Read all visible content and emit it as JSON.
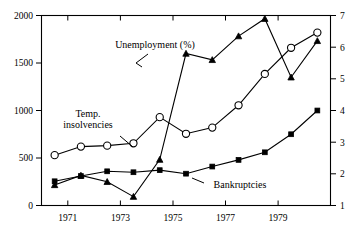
{
  "chart_data": {
    "type": "line",
    "title": "",
    "subtitle": "",
    "xlabel": "",
    "ylabel": "",
    "y2label": "",
    "grid": false,
    "legend_position": "inline-annotations",
    "x": [
      1970,
      1971,
      1972,
      1973,
      1974,
      1975,
      1976,
      1977,
      1978,
      1979,
      1980
    ],
    "xlim": [
      1969.5,
      1980.5
    ],
    "xticks_major": [
      1971,
      1973,
      1975,
      1977,
      1979
    ],
    "xtick_labels": [
      "1971",
      "1973",
      "1975",
      "1977",
      "1979"
    ],
    "xticks_minor": [
      1970,
      1972,
      1974,
      1976,
      1978,
      1980
    ],
    "left_axis": {
      "ylim": [
        0,
        2000
      ],
      "ticks": [
        0,
        500,
        1000,
        1500,
        2000
      ],
      "tick_labels": [
        "0",
        "500",
        "1000",
        "1500",
        "2000"
      ]
    },
    "right_axis": {
      "ylim": [
        1,
        7
      ],
      "ticks": [
        1,
        2,
        3,
        4,
        5,
        6,
        7
      ],
      "tick_labels": [
        "1",
        "2",
        "3",
        "4",
        "5",
        "6",
        "7"
      ]
    },
    "series": [
      {
        "name": "Temp. insolvencies",
        "label": "Temp.",
        "label_line2": "insolvencies",
        "axis": "left",
        "marker": "circle-open",
        "values": [
          530,
          620,
          630,
          655,
          930,
          755,
          820,
          1055,
          1385,
          1660,
          1820
        ]
      },
      {
        "name": "Bankruptcies",
        "label": "Bankruptcies",
        "axis": "left",
        "marker": "square-filled",
        "values": [
          255,
          310,
          360,
          350,
          372,
          335,
          410,
          480,
          560,
          750,
          1000
        ]
      },
      {
        "name": "Unemployment (%)",
        "label": "Unemployment (%)",
        "axis": "right",
        "marker": "triangle-filled",
        "values": [
          1.65,
          1.95,
          1.75,
          1.28,
          2.45,
          5.8,
          5.6,
          6.35,
          6.9,
          5.05,
          6.2
        ]
      }
    ],
    "annotations": [
      {
        "text": "Unemployment (%)",
        "x_px": 155,
        "y_px": 48
      },
      {
        "text": "Temp.",
        "x_px": 76,
        "y_px": 117
      },
      {
        "text": "insolvencies",
        "x_px": 60,
        "y_px": 128
      },
      {
        "text": "Bankruptcies",
        "x_px": 207,
        "y_px": 186
      }
    ]
  }
}
